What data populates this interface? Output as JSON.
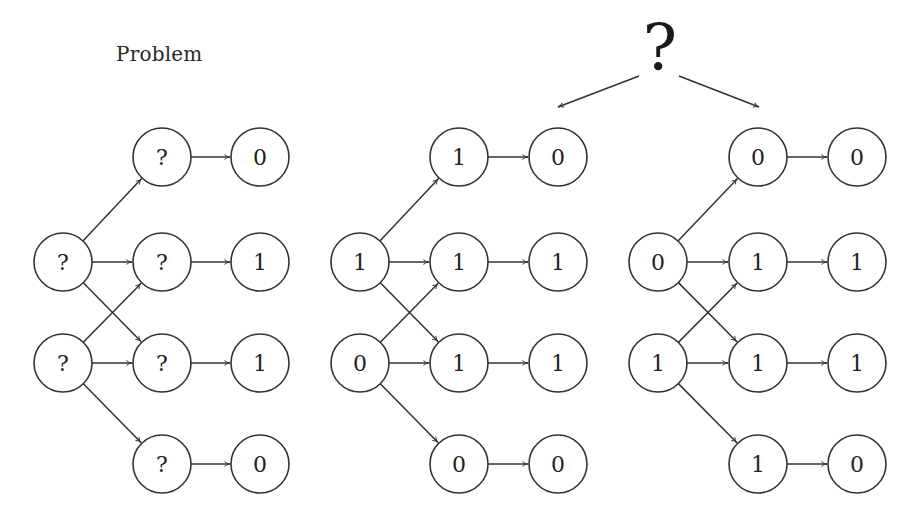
{
  "title": "Problem",
  "choice_symbol": "?",
  "colors": {
    "stroke": "#333333",
    "text": "#222222",
    "background": "#ffffff"
  },
  "layout": {
    "rows_y": [
      157,
      262,
      363,
      464
    ],
    "node_radius": 29
  },
  "panels": [
    {
      "name": "problem",
      "columns_x": [
        63,
        162,
        260
      ],
      "inputs": [
        {
          "row": 1,
          "label": "?"
        },
        {
          "row": 2,
          "label": "?"
        }
      ],
      "hidden": [
        {
          "row": 0,
          "label": "?"
        },
        {
          "row": 1,
          "label": "?"
        },
        {
          "row": 2,
          "label": "?"
        },
        {
          "row": 3,
          "label": "?"
        }
      ],
      "outputs": [
        {
          "row": 0,
          "label": "0"
        },
        {
          "row": 1,
          "label": "1"
        },
        {
          "row": 2,
          "label": "1"
        },
        {
          "row": 3,
          "label": "0"
        }
      ],
      "edges": [
        {
          "from": 1,
          "to": 0
        },
        {
          "from": 1,
          "to": 1
        },
        {
          "from": 1,
          "to": 2
        },
        {
          "from": 2,
          "to": 1
        },
        {
          "from": 2,
          "to": 2
        },
        {
          "from": 2,
          "to": 3
        }
      ]
    },
    {
      "name": "solution-a",
      "columns_x": [
        360,
        459,
        558
      ],
      "inputs": [
        {
          "row": 1,
          "label": "1"
        },
        {
          "row": 2,
          "label": "0"
        }
      ],
      "hidden": [
        {
          "row": 0,
          "label": "1"
        },
        {
          "row": 1,
          "label": "1"
        },
        {
          "row": 2,
          "label": "1"
        },
        {
          "row": 3,
          "label": "0"
        }
      ],
      "outputs": [
        {
          "row": 0,
          "label": "0"
        },
        {
          "row": 1,
          "label": "1"
        },
        {
          "row": 2,
          "label": "1"
        },
        {
          "row": 3,
          "label": "0"
        }
      ],
      "edges": [
        {
          "from": 1,
          "to": 0
        },
        {
          "from": 1,
          "to": 1
        },
        {
          "from": 1,
          "to": 2
        },
        {
          "from": 2,
          "to": 1
        },
        {
          "from": 2,
          "to": 2
        },
        {
          "from": 2,
          "to": 3
        }
      ]
    },
    {
      "name": "solution-b",
      "columns_x": [
        658,
        758,
        857
      ],
      "inputs": [
        {
          "row": 1,
          "label": "0"
        },
        {
          "row": 2,
          "label": "1"
        }
      ],
      "hidden": [
        {
          "row": 0,
          "label": "0"
        },
        {
          "row": 1,
          "label": "1"
        },
        {
          "row": 2,
          "label": "1"
        },
        {
          "row": 3,
          "label": "1"
        }
      ],
      "outputs": [
        {
          "row": 0,
          "label": "0"
        },
        {
          "row": 1,
          "label": "1"
        },
        {
          "row": 2,
          "label": "1"
        },
        {
          "row": 3,
          "label": "0"
        }
      ],
      "edges": [
        {
          "from": 1,
          "to": 0
        },
        {
          "from": 1,
          "to": 1
        },
        {
          "from": 1,
          "to": 2
        },
        {
          "from": 2,
          "to": 1
        },
        {
          "from": 2,
          "to": 2
        },
        {
          "from": 2,
          "to": 3
        }
      ]
    }
  ],
  "choice_arrows": [
    {
      "name": "arrow-to-solution-a",
      "x1": 639,
      "y1": 76,
      "x2": 558,
      "y2": 107
    },
    {
      "name": "arrow-to-solution-b",
      "x1": 679,
      "y1": 76,
      "x2": 759,
      "y2": 107
    }
  ]
}
